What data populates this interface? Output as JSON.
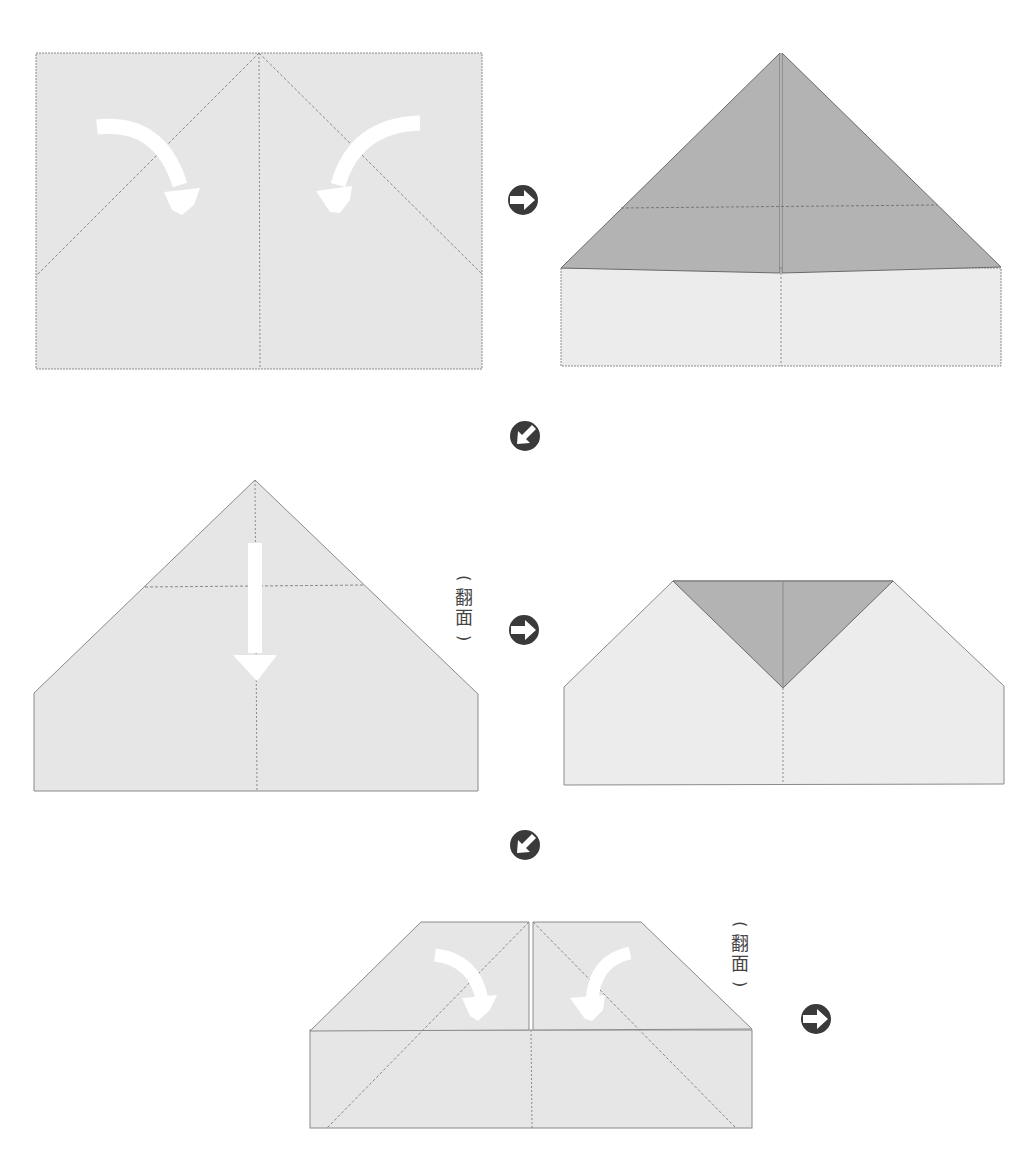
{
  "diagram": {
    "type": "origami-instructions",
    "colors": {
      "paper_light": "#e6e6e6",
      "paper_lighter": "#ececec",
      "paper_dark": "#b3b3b3",
      "crease_line": "#8a8a8a",
      "fold_arrow": "#ffffff",
      "step_icon": "#3a3a3a"
    },
    "steps": [
      {
        "id": 1,
        "description": "Fold top corners to center crease",
        "arrows": [
          "curved-right-down",
          "curved-left-down"
        ]
      },
      {
        "id": 2,
        "description": "Result: triangle top (dark folded flaps) over rectangle"
      },
      {
        "id": 3,
        "description": "Fold top point down along horizontal crease",
        "arrows": [
          "straight-down"
        ]
      },
      {
        "id": 4,
        "description": "Result: inverted dark triangle in center"
      },
      {
        "id": 5,
        "description": "Fold top corners to center crease again",
        "arrows": [
          "curved-right-down",
          "curved-left-down"
        ]
      }
    ],
    "flip_labels": [
      {
        "text_top": "翻",
        "text_bottom": "面",
        "open": "(",
        "close": ")"
      },
      {
        "text_top": "翻",
        "text_bottom": "面",
        "open": "(",
        "close": ")"
      }
    ],
    "step_icons": [
      {
        "name": "next-right",
        "glyph": "right-arrow"
      },
      {
        "name": "next-down-left",
        "glyph": "down-left-arrow"
      },
      {
        "name": "next-right",
        "glyph": "right-arrow"
      },
      {
        "name": "next-down-left",
        "glyph": "down-left-arrow"
      },
      {
        "name": "next-right",
        "glyph": "right-arrow"
      }
    ]
  }
}
